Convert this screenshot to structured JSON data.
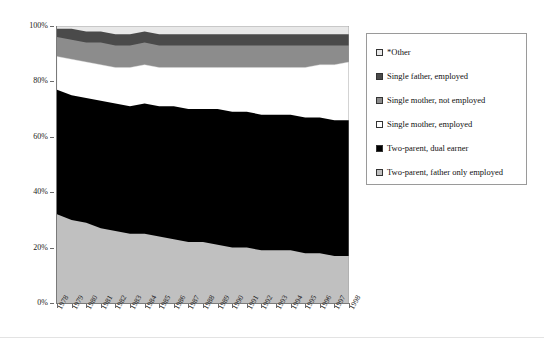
{
  "chart_data": {
    "type": "area",
    "stacked": true,
    "normalized": "100%",
    "title": "",
    "xlabel": "",
    "ylabel": "",
    "grid": false,
    "ylim": [
      0,
      100
    ],
    "ytick_labels": [
      "0%",
      "20%",
      "40%",
      "60%",
      "80%",
      "100%"
    ],
    "ytick_values": [
      0,
      20,
      40,
      60,
      80,
      100
    ],
    "legend_position": "right",
    "categories": [
      "1978",
      "1979",
      "1980",
      "1981",
      "1982",
      "1983",
      "1984",
      "1985",
      "1986",
      "1987",
      "1988",
      "1989",
      "1990",
      "1991",
      "1992",
      "1993",
      "1994",
      "1995",
      "1996",
      "1997",
      "1998"
    ],
    "series": [
      {
        "name": "Two-parent, father only employed",
        "color": "#c0c0c0",
        "values": [
          32,
          30,
          29,
          27,
          26,
          25,
          25,
          24,
          23,
          22,
          22,
          21,
          20,
          20,
          19,
          19,
          19,
          18,
          18,
          17,
          17
        ]
      },
      {
        "name": "Two-parent, dual earner",
        "color": "#000000",
        "values": [
          45,
          45,
          45,
          46,
          46,
          46,
          47,
          47,
          48,
          48,
          48,
          49,
          49,
          49,
          49,
          49,
          49,
          49,
          49,
          49,
          49
        ]
      },
      {
        "name": "Single mother, employed",
        "color": "#ffffff",
        "values": [
          12,
          13,
          13,
          13,
          13,
          14,
          14,
          14,
          14,
          15,
          15,
          15,
          16,
          16,
          17,
          17,
          17,
          18,
          19,
          20,
          21
        ]
      },
      {
        "name": "Single mother, not employed",
        "color": "#8c8c8c",
        "values": [
          7,
          7,
          7,
          8,
          8,
          8,
          8,
          8,
          8,
          8,
          8,
          8,
          8,
          8,
          8,
          8,
          8,
          8,
          7,
          7,
          6
        ]
      },
      {
        "name": "Single father, employed",
        "color": "#4a4a4a",
        "values": [
          3,
          4,
          4,
          4,
          4,
          4,
          4,
          4,
          4,
          4,
          4,
          4,
          4,
          4,
          4,
          4,
          4,
          4,
          4,
          4,
          4
        ]
      },
      {
        "name": "*Other",
        "color": "#e8e8e8",
        "values": [
          1,
          1,
          2,
          2,
          3,
          3,
          2,
          3,
          3,
          3,
          3,
          3,
          3,
          3,
          3,
          3,
          3,
          3,
          3,
          3,
          3
        ]
      }
    ],
    "legend_entries": [
      {
        "label": "*Other",
        "color": "#e8e8e8"
      },
      {
        "label": "Single father, employed",
        "color": "#4a4a4a"
      },
      {
        "label": "Single mother, not employed",
        "color": "#8c8c8c"
      },
      {
        "label": "Single mother, employed",
        "color": "#ffffff"
      },
      {
        "label": "Two-parent, dual earner",
        "color": "#000000"
      },
      {
        "label": "Two-parent, father only employed",
        "color": "#c0c0c0"
      }
    ]
  }
}
